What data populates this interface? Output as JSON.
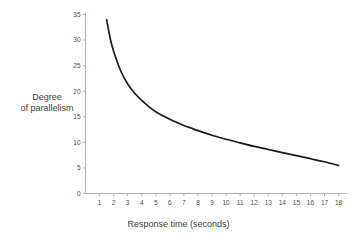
{
  "chart_data": {
    "type": "line",
    "title": "",
    "xlabel": "Response time (seconds)",
    "ylabel_line1": "Degree",
    "ylabel_line2": "of parallelism",
    "xlim": [
      0,
      18.6
    ],
    "ylim": [
      0,
      35
    ],
    "grid": false,
    "legend": null,
    "line_color": "#1a1a1a",
    "axis_color": "#b3b3b3",
    "xticks": [
      1,
      2,
      3,
      4,
      5,
      6,
      7,
      8,
      9,
      10,
      11,
      12,
      13,
      14,
      15,
      16,
      17,
      18
    ],
    "xtick_labels": [
      "1",
      "2",
      "3",
      "4",
      "5",
      "6",
      "7",
      "8",
      "9",
      "10",
      "11",
      "12",
      "13",
      "14",
      "15",
      "16",
      "17",
      "18"
    ],
    "yticks": [
      0,
      5,
      10,
      15,
      20,
      25,
      30,
      35
    ],
    "ytick_labels": [
      "0",
      "5",
      "10",
      "15",
      "20",
      "25",
      "30",
      "35"
    ],
    "x": [
      1.5,
      1.75,
      2,
      2.5,
      3,
      3.5,
      4,
      4.5,
      5,
      5.5,
      6,
      6.5,
      7,
      7.5,
      8,
      9,
      10,
      11,
      12,
      13,
      14,
      15,
      16,
      17,
      18
    ],
    "values": [
      34.0,
      30.4,
      27.8,
      24.0,
      21.4,
      19.6,
      18.2,
      17.0,
      16.0,
      15.2,
      14.5,
      13.9,
      13.3,
      12.8,
      12.3,
      11.4,
      10.6,
      9.9,
      9.2,
      8.6,
      8.0,
      7.4,
      6.8,
      6.2,
      5.5
    ]
  }
}
